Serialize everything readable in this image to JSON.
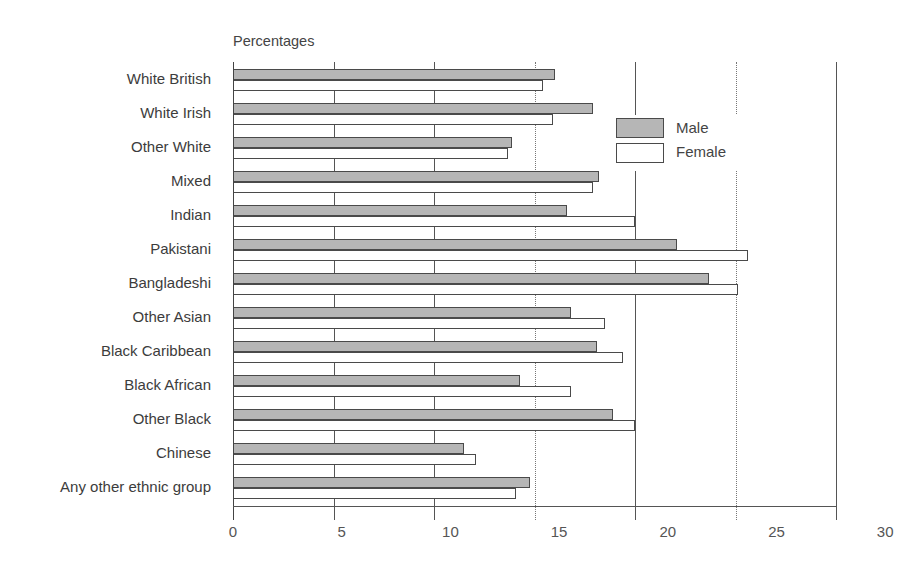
{
  "chart_data": {
    "type": "bar",
    "orientation": "horizontal",
    "title": "",
    "unit_label": "Percentages",
    "xlabel": "",
    "ylabel": "",
    "xlim": [
      0,
      30
    ],
    "x_ticks": [
      0,
      5,
      10,
      15,
      20,
      25,
      30
    ],
    "grid": true,
    "legend_position": "upper right inside plot",
    "categories": [
      "White British",
      "White Irish",
      "Other White",
      "Mixed",
      "Indian",
      "Pakistani",
      "Bangladeshi",
      "Other Asian",
      "Black Caribbean",
      "Black African",
      "Other Black",
      "Chinese",
      "Any other ethnic group"
    ],
    "series": [
      {
        "name": "Male",
        "color": "#b6b6b6",
        "values": [
          16.0,
          17.9,
          13.9,
          18.2,
          16.6,
          22.1,
          23.7,
          16.8,
          18.1,
          14.3,
          18.9,
          11.5,
          14.8
        ]
      },
      {
        "name": "Female",
        "color": "#ffffff",
        "values": [
          15.4,
          15.9,
          13.7,
          17.9,
          20.0,
          25.6,
          25.1,
          18.5,
          19.4,
          16.8,
          20.0,
          12.1,
          14.1
        ]
      }
    ]
  },
  "labels": {
    "unit": "Percentages",
    "ticks": [
      "0",
      "5",
      "10",
      "15",
      "20",
      "25",
      "30"
    ],
    "legend": {
      "male": "Male",
      "female": "Female"
    }
  },
  "colors": {
    "male_fill": "#b6b6b6",
    "female_fill": "#ffffff",
    "bar_border": "#4a4a4a",
    "axis": "#555555"
  }
}
